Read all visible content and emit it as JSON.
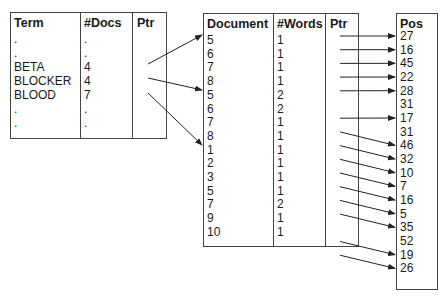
{
  "term_table": {
    "headers": [
      "Term",
      "#Docs",
      "Ptr"
    ],
    "rows": [
      {
        "term": ".",
        "docs": "."
      },
      {
        "term": ".",
        "docs": "."
      },
      {
        "term": "BETA",
        "docs": "4"
      },
      {
        "term": "BLOCKER",
        "docs": "4"
      },
      {
        "term": "BLOOD",
        "docs": "7"
      },
      {
        "term": ".",
        "docs": "."
      },
      {
        "term": ".",
        "docs": "."
      }
    ]
  },
  "document_table": {
    "headers": [
      "Document",
      "#Words",
      "Ptr"
    ],
    "rows": [
      {
        "doc": "5",
        "words": "1"
      },
      {
        "doc": "6",
        "words": "1"
      },
      {
        "doc": "7",
        "words": "1"
      },
      {
        "doc": "8",
        "words": "1"
      },
      {
        "doc": "5",
        "words": "2"
      },
      {
        "doc": "6",
        "words": "2"
      },
      {
        "doc": "7",
        "words": "1"
      },
      {
        "doc": "8",
        "words": "1"
      },
      {
        "doc": "1",
        "words": "1"
      },
      {
        "doc": "2",
        "words": "1"
      },
      {
        "doc": "3",
        "words": "1"
      },
      {
        "doc": "5",
        "words": "1"
      },
      {
        "doc": "7",
        "words": "2"
      },
      {
        "doc": "9",
        "words": "1"
      },
      {
        "doc": "10",
        "words": "1"
      }
    ]
  },
  "position_table": {
    "header": "Pos",
    "values": [
      "27",
      "16",
      "45",
      "22",
      "28",
      "31",
      "17",
      "31",
      "46",
      "32",
      "10",
      "7",
      "16",
      "5",
      "35",
      "52",
      "19",
      "26"
    ]
  }
}
